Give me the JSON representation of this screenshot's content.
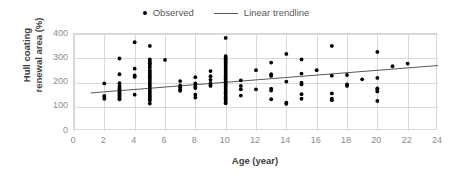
{
  "legend": {
    "position": "top-center",
    "entries": [
      {
        "label": "Observed",
        "marker": "dot",
        "color": "#000000"
      },
      {
        "label": "Linear trendline",
        "marker": "line",
        "color": "#595959"
      }
    ]
  },
  "axes": {
    "x_title": "Age (year)",
    "y_title": "Hull coating\nrenewal area (%)",
    "x_ticks": [
      "0",
      "2",
      "4",
      "6",
      "8",
      "10",
      "12",
      "14",
      "16",
      "18",
      "20",
      "22",
      "24"
    ],
    "y_ticks": [
      "400",
      "300",
      "200",
      "100",
      "0"
    ]
  },
  "colors": {
    "marker": "#000000",
    "trendline": "#595959",
    "gridline": "#d9d9d9",
    "plot_border": "#d9d9d9",
    "tick_text": "#8c8c8c",
    "axis_title_text": "#404040",
    "legend_text": "#595959",
    "background": "#ffffff"
  },
  "chart_data": {
    "type": "scatter",
    "title": "",
    "subtitle": "",
    "xlabel": "Age (year)",
    "ylabel": "Hull coating renewal area (%)",
    "xlim": [
      0,
      24
    ],
    "ylim": [
      0,
      400
    ],
    "xtick_step": 2,
    "ytick_step": 100,
    "grid": true,
    "grid_axes": "both",
    "legend": [
      "Observed",
      "Linear trendline"
    ],
    "legend_position": "top-center",
    "series": [
      {
        "name": "Observed",
        "type": "scatter",
        "marker": "circle",
        "color": "#000000",
        "points": [
          [
            2,
            196
          ],
          [
            2,
            145
          ],
          [
            2,
            140
          ],
          [
            2,
            133
          ],
          [
            3,
            299
          ],
          [
            3,
            234
          ],
          [
            3,
            197
          ],
          [
            3,
            186
          ],
          [
            3,
            178
          ],
          [
            3,
            172
          ],
          [
            3,
            166
          ],
          [
            3,
            161
          ],
          [
            3,
            156
          ],
          [
            3,
            150
          ],
          [
            3,
            145
          ],
          [
            3,
            140
          ],
          [
            3,
            134
          ],
          [
            3,
            131
          ],
          [
            4,
            366
          ],
          [
            4,
            257
          ],
          [
            4,
            229
          ],
          [
            4,
            223
          ],
          [
            4,
            150
          ],
          [
            5,
            351
          ],
          [
            5,
            295
          ],
          [
            5,
            287
          ],
          [
            5,
            279
          ],
          [
            5,
            272
          ],
          [
            5,
            262
          ],
          [
            5,
            251
          ],
          [
            5,
            243
          ],
          [
            5,
            236
          ],
          [
            5,
            229
          ],
          [
            5,
            222
          ],
          [
            5,
            214
          ],
          [
            5,
            206
          ],
          [
            5,
            198
          ],
          [
            5,
            190
          ],
          [
            5,
            182
          ],
          [
            5,
            174
          ],
          [
            5,
            166
          ],
          [
            5,
            158
          ],
          [
            5,
            150
          ],
          [
            5,
            142
          ],
          [
            5,
            134
          ],
          [
            5,
            126
          ],
          [
            5,
            113
          ],
          [
            6,
            293
          ],
          [
            7,
            206
          ],
          [
            7,
            188
          ],
          [
            7,
            180
          ],
          [
            7,
            172
          ],
          [
            7,
            166
          ],
          [
            8,
            222
          ],
          [
            8,
            196
          ],
          [
            8,
            184
          ],
          [
            8,
            177
          ],
          [
            8,
            150
          ],
          [
            8,
            138
          ],
          [
            9,
            247
          ],
          [
            9,
            226
          ],
          [
            9,
            211
          ],
          [
            9,
            197
          ],
          [
            9,
            190
          ],
          [
            9,
            186
          ],
          [
            10,
            384
          ],
          [
            10,
            309
          ],
          [
            10,
            302
          ],
          [
            10,
            296
          ],
          [
            10,
            289
          ],
          [
            10,
            283
          ],
          [
            10,
            276
          ],
          [
            10,
            269
          ],
          [
            10,
            262
          ],
          [
            10,
            254
          ],
          [
            10,
            247
          ],
          [
            10,
            240
          ],
          [
            10,
            233
          ],
          [
            10,
            226
          ],
          [
            10,
            219
          ],
          [
            10,
            212
          ],
          [
            10,
            205
          ],
          [
            10,
            198
          ],
          [
            10,
            191
          ],
          [
            10,
            184
          ],
          [
            10,
            177
          ],
          [
            10,
            170
          ],
          [
            10,
            163
          ],
          [
            10,
            156
          ],
          [
            10,
            149
          ],
          [
            10,
            142
          ],
          [
            10,
            135
          ],
          [
            10,
            128
          ],
          [
            10,
            121
          ],
          [
            10,
            114
          ],
          [
            11,
            209
          ],
          [
            11,
            186
          ],
          [
            11,
            172
          ],
          [
            11,
            146
          ],
          [
            12,
            251
          ],
          [
            12,
            172
          ],
          [
            13,
            282
          ],
          [
            13,
            234
          ],
          [
            13,
            227
          ],
          [
            13,
            175
          ],
          [
            13,
            167
          ],
          [
            13,
            131
          ],
          [
            14,
            318
          ],
          [
            14,
            204
          ],
          [
            14,
            117
          ],
          [
            14,
            112
          ],
          [
            15,
            295
          ],
          [
            15,
            237
          ],
          [
            15,
            199
          ],
          [
            15,
            192
          ],
          [
            15,
            152
          ],
          [
            15,
            133
          ],
          [
            16,
            251
          ],
          [
            17,
            351
          ],
          [
            17,
            228
          ],
          [
            17,
            155
          ],
          [
            17,
            133
          ],
          [
            17,
            127
          ],
          [
            18,
            231
          ],
          [
            18,
            192
          ],
          [
            18,
            186
          ],
          [
            19,
            213
          ],
          [
            20,
            326
          ],
          [
            20,
            219
          ],
          [
            20,
            176
          ],
          [
            20,
            170
          ],
          [
            20,
            163
          ],
          [
            20,
            124
          ],
          [
            21,
            267
          ],
          [
            22,
            278
          ]
        ]
      },
      {
        "name": "Linear trendline",
        "type": "line",
        "color": "#595959",
        "x_start": 1.1,
        "y_start": 157,
        "x_end": 24,
        "y_end": 270,
        "slope": 4.93,
        "intercept": 151.6
      }
    ]
  }
}
